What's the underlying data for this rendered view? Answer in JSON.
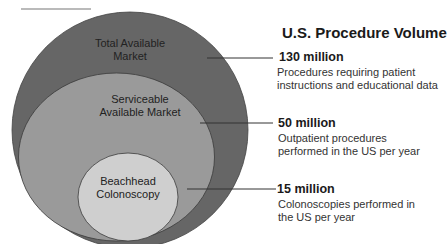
{
  "title": "U.S. Procedure Volume",
  "circles": [
    {
      "label_line1": "Total Available",
      "label_line2": "Market",
      "color": "#666666"
    },
    {
      "label_line1": "Serviceable",
      "label_line2": "Available Market",
      "color": "#9a9a9a"
    },
    {
      "label_line1": "Beachhead",
      "label_line2": "Colonoscopy",
      "color": "#cfcfcf"
    }
  ],
  "callouts": [
    {
      "value": "130 million",
      "description": "Procedures requiring patient instructions and educational data"
    },
    {
      "value": "50 million",
      "description": "Outpatient procedures performed in the US per year"
    },
    {
      "value": "15 million",
      "description": "Colonoscopies performed in the US per year"
    }
  ]
}
